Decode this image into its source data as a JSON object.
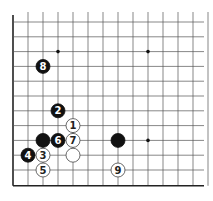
{
  "board": {
    "origin_x": 13,
    "origin_y": 22,
    "spacing_x": 15,
    "spacing_y": 14.8,
    "cols": 14,
    "rows": 12,
    "left_edge": true,
    "bottom_edge": true,
    "line_color": "#555555",
    "edge_color": "#222222"
  },
  "star_points": [
    {
      "col": 3,
      "row": 2
    },
    {
      "col": 9,
      "row": 2
    },
    {
      "col": 9,
      "row": 8
    }
  ],
  "stones": [
    {
      "color": "black",
      "col": 2,
      "row": 3,
      "label": "8"
    },
    {
      "color": "black",
      "col": 3,
      "row": 6,
      "label": "2"
    },
    {
      "color": "white",
      "col": 4,
      "row": 7,
      "label": "1"
    },
    {
      "color": "black",
      "col": 2,
      "row": 8,
      "label": ""
    },
    {
      "color": "black",
      "col": 3,
      "row": 8,
      "label": "6"
    },
    {
      "color": "white",
      "col": 4,
      "row": 8,
      "label": "7"
    },
    {
      "color": "black",
      "col": 7,
      "row": 8,
      "label": ""
    },
    {
      "color": "black",
      "col": 1,
      "row": 9,
      "label": "4"
    },
    {
      "color": "white",
      "col": 2,
      "row": 9,
      "label": "3"
    },
    {
      "color": "white",
      "col": 4,
      "row": 9,
      "label": ""
    },
    {
      "color": "white",
      "col": 2,
      "row": 10,
      "label": "5"
    },
    {
      "color": "white",
      "col": 7,
      "row": 10,
      "label": "9"
    }
  ]
}
